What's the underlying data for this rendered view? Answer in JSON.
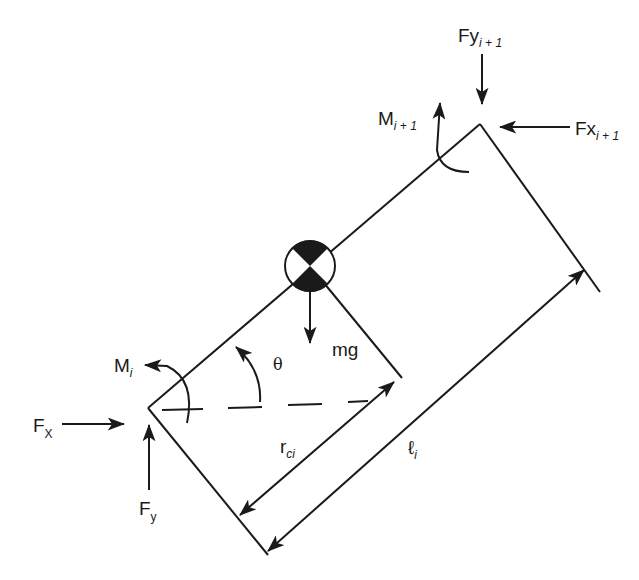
{
  "diagram": {
    "labels": {
      "fy_next": {
        "main": "Fy",
        "sub": "i + 1"
      },
      "fx_next": {
        "main": "Fx",
        "sub": "i + 1"
      },
      "m_next": {
        "main": "M",
        "sub": "i + 1"
      },
      "m_i": {
        "main": "M",
        "sub": "i"
      },
      "fx": {
        "main": "F",
        "sub": "X"
      },
      "fy": {
        "main": "F",
        "sub": "y"
      },
      "mg": "mg",
      "theta": "θ",
      "r_ci": {
        "main": "r",
        "sub": "ci"
      },
      "l_i": {
        "main": "ℓ",
        "sub": "i"
      }
    },
    "elements": [
      "link-body-rectangle",
      "center-of-mass-symbol",
      "gravity-force-arrow",
      "angle-theta-arc",
      "horizontal-reference-dashed-line",
      "distance-r-ci-dimension",
      "length-l-i-dimension",
      "force-fx-arrow",
      "force-fy-arrow",
      "moment-mi-arc",
      "force-fx-next-arrow",
      "force-fy-next-arrow",
      "moment-m-next-arc"
    ],
    "colors": {
      "stroke": "#1a1a1a",
      "background": "#ffffff"
    }
  }
}
